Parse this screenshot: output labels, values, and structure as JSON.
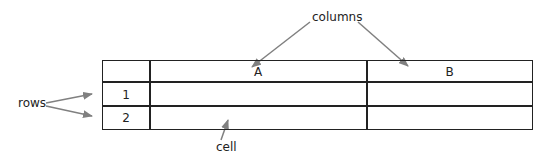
{
  "annotations": {
    "columns": "columns",
    "rows": "rows",
    "cell": "cell"
  },
  "table": {
    "column_headers": [
      "",
      "A",
      "B"
    ],
    "row_headers": [
      "1",
      "2"
    ],
    "rows": [
      [
        "",
        ""
      ],
      [
        "",
        ""
      ]
    ]
  },
  "colors": {
    "lines": "#222222",
    "arrows": "#808080",
    "background": "#ffffff"
  }
}
